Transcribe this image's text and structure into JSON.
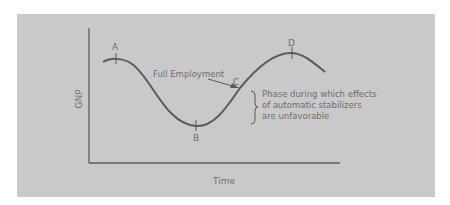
{
  "diagram": {
    "type": "business-cycle",
    "y_axis_label": "GNP",
    "x_axis_label": "Time",
    "points": [
      {
        "id": "A",
        "label": "A",
        "role": "peak"
      },
      {
        "id": "B",
        "label": "B",
        "role": "trough"
      },
      {
        "id": "C",
        "label": "C",
        "role": "full-employment crossing"
      },
      {
        "id": "D",
        "label": "D",
        "role": "peak"
      }
    ],
    "annotation_arrow_label": "Full Employment",
    "brace_note_lines": [
      "Phase during which effects",
      "of automatic stabilizers",
      "are unfavorable"
    ],
    "colors": {
      "background": "#c9c9c9",
      "ink": "#5a5a5a"
    }
  }
}
